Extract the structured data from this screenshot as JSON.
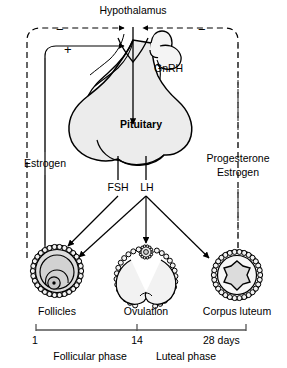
{
  "figure": {
    "type": "biological-flow-diagram"
  },
  "nodes": {
    "hypothalamus": "Hypothalamus",
    "pituitary": "Pituitary",
    "gnrh": "GnRH",
    "fsh": "FSH",
    "lh": "LH",
    "estrogen_left": "Estrogen",
    "progesterone_right": "Progesterone",
    "estrogen_right": "Estrogen",
    "follicles": "Follicles",
    "ovulation": "Ovulation",
    "corpus_luteum": "Corpus luteum"
  },
  "feedback": {
    "negative_left": "−",
    "positive_left": "+",
    "negative_right": "−"
  },
  "timeline": {
    "ticks": [
      "1",
      "14",
      "28 days"
    ],
    "phases": [
      "Follicular phase",
      "Luteal phase"
    ]
  },
  "colors": {
    "stroke": "#000000",
    "organ_fill": "#ececec",
    "organ_fill_light": "#f4f4f4",
    "follicle_inner": "#d8d8d8",
    "follicle_core": "#c9c9c9",
    "corpus_star": "#dcdcdc",
    "axis_line": "#555555",
    "dash_line": "#444444"
  }
}
